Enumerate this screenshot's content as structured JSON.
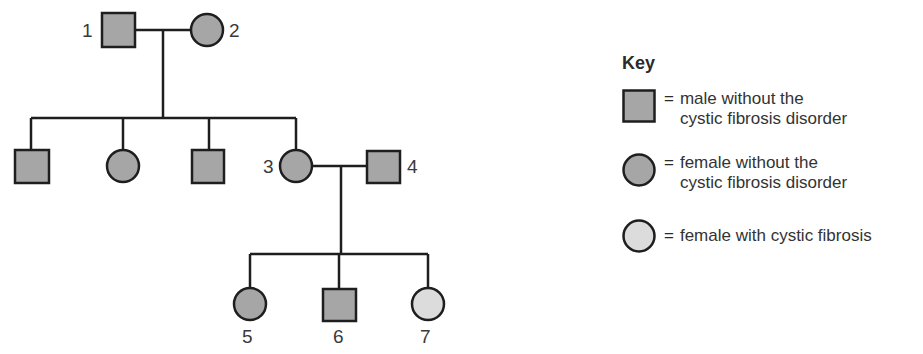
{
  "colors": {
    "unaffected_fill": "#a6a6a6",
    "affected_fill": "#dcdcdc",
    "stroke": "#1e1e1e"
  },
  "individuals": [
    {
      "id": "1",
      "label": "1",
      "sex": "male",
      "status": "without cystic fibrosis"
    },
    {
      "id": "2",
      "label": "2",
      "sex": "female",
      "status": "without cystic fibrosis"
    },
    {
      "id": "g2a",
      "label": "",
      "sex": "male",
      "status": "without cystic fibrosis"
    },
    {
      "id": "g2b",
      "label": "",
      "sex": "female",
      "status": "without cystic fibrosis"
    },
    {
      "id": "g2c",
      "label": "",
      "sex": "male",
      "status": "without cystic fibrosis"
    },
    {
      "id": "3",
      "label": "3",
      "sex": "female",
      "status": "without cystic fibrosis"
    },
    {
      "id": "4",
      "label": "4",
      "sex": "male",
      "status": "without cystic fibrosis"
    },
    {
      "id": "5",
      "label": "5",
      "sex": "female",
      "status": "without cystic fibrosis"
    },
    {
      "id": "6",
      "label": "6",
      "sex": "male",
      "status": "without cystic fibrosis"
    },
    {
      "id": "7",
      "label": "7",
      "sex": "female",
      "status": "with cystic fibrosis"
    }
  ],
  "key": {
    "title": "Key",
    "equals": "=",
    "items": [
      {
        "symbol": "square",
        "line1": "male without the",
        "line2": "cystic fibrosis disorder"
      },
      {
        "symbol": "circle",
        "line1": "female without the",
        "line2": "cystic fibrosis disorder"
      },
      {
        "symbol": "circle-light",
        "line1": "female with cystic fibrosis",
        "line2": ""
      }
    ]
  }
}
